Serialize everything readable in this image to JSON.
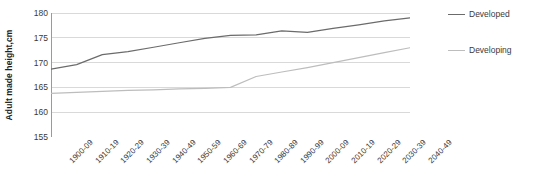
{
  "chart_data": {
    "type": "line",
    "title": "",
    "xlabel": "",
    "ylabel": "Adult made height,cm",
    "ylim": [
      155,
      180
    ],
    "yticks": [
      155,
      160,
      165,
      170,
      175,
      180
    ],
    "grid": true,
    "legend_position": "right",
    "categories": [
      "1900-09",
      "1910-19",
      "1920-29",
      "1930-39",
      "1940-49",
      "1950-59",
      "1960-69",
      "1970-79",
      "1980-89",
      "1990-99",
      "2000-09",
      "2010-19",
      "2020-29",
      "2030-39",
      "2040-49"
    ],
    "series": [
      {
        "name": "Developed",
        "color": "#6b6b6b",
        "values": [
          168.7,
          169.6,
          171.6,
          172.2,
          173.1,
          174.0,
          174.9,
          175.5,
          175.6,
          176.4,
          176.1,
          176.9,
          177.6,
          178.4,
          179.0
        ]
      },
      {
        "name": "Developing",
        "color": "#bdbdbd",
        "values": [
          163.8,
          164.0,
          164.2,
          164.4,
          164.5,
          164.7,
          164.8,
          165.0,
          167.2,
          168.1,
          169.0,
          170.0,
          171.0,
          172.0,
          173.0
        ]
      }
    ]
  },
  "legend": {
    "items": [
      {
        "label": "Developed",
        "color": "#6b6b6b"
      },
      {
        "label": "Developing",
        "color": "#bdbdbd"
      }
    ]
  },
  "axis": {
    "y_title": "Adult made height,cm",
    "axis_color": "#9a9a9a",
    "grid_color": "#d9d9d9"
  }
}
